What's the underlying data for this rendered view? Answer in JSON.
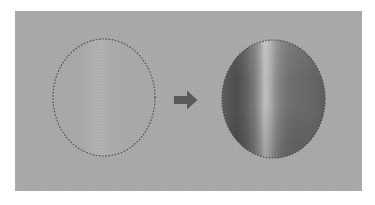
{
  "figure": {
    "title": "Gradient fill applied inside an elliptical selection",
    "caption": "",
    "background_color": "#ffffff",
    "canvas_color": "#a9a9a9"
  },
  "before": {
    "label": "Empty elliptical selection",
    "selection_name": "elliptical-marquee-selection",
    "marching_ants_color": "#4a4a4a",
    "fill_state": "none",
    "bounds": {
      "x": 53,
      "y": 39,
      "width": 102,
      "height": 117
    }
  },
  "arrow": {
    "name": "right-arrow-icon",
    "direction": "right",
    "color": "#5a5a5a",
    "label": ""
  },
  "after": {
    "label": "Selection filled with reflected gradient",
    "selection_name": "filled-elliptical-selection",
    "marching_ants_color": "#3d3d3d",
    "fill_state": "reflected-gradient",
    "gradient_type": "reflected",
    "gradient_angle_deg": 0,
    "gradient_stops": [
      "#5f5f5f",
      "#4e4e4e",
      "#bdbdbd",
      "#7a7a7a",
      "#5e5e5e"
    ],
    "highlight_position_pct": 42,
    "bounds": {
      "x": 222,
      "y": 40,
      "width": 103,
      "height": 118
    }
  }
}
